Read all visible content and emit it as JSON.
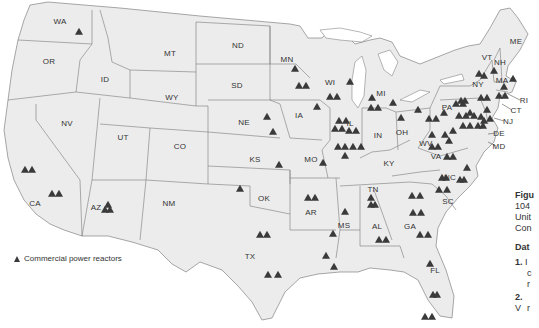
{
  "legend": {
    "icon": "triangle-reactor-icon",
    "label": "Commercial power reactors"
  },
  "caption": {
    "figure_prefix": "Figu",
    "line1": "104",
    "line2": "Unit",
    "line3": "Con",
    "data_heading": "Dat",
    "questions": [
      {
        "num": "1.",
        "lines": [
          "I",
          "c",
          "r"
        ]
      },
      {
        "num": "2.",
        "lines": [
          "V",
          "r"
        ]
      }
    ]
  },
  "states": [
    {
      "abbr": "WA",
      "x": 60,
      "y": 21
    },
    {
      "abbr": "OR",
      "x": 49,
      "y": 61
    },
    {
      "abbr": "ID",
      "x": 105,
      "y": 79
    },
    {
      "abbr": "MT",
      "x": 170,
      "y": 53
    },
    {
      "abbr": "WY",
      "x": 172,
      "y": 97
    },
    {
      "abbr": "NV",
      "x": 67,
      "y": 123
    },
    {
      "abbr": "UT",
      "x": 123,
      "y": 137
    },
    {
      "abbr": "CO",
      "x": 180,
      "y": 146
    },
    {
      "abbr": "CA",
      "x": 35,
      "y": 203
    },
    {
      "abbr": "AZ",
      "x": 96,
      "y": 207
    },
    {
      "abbr": "NM",
      "x": 169,
      "y": 203
    },
    {
      "abbr": "ND",
      "x": 238,
      "y": 45
    },
    {
      "abbr": "SD",
      "x": 237,
      "y": 85
    },
    {
      "abbr": "NE",
      "x": 244,
      "y": 122
    },
    {
      "abbr": "KS",
      "x": 255,
      "y": 159
    },
    {
      "abbr": "OK",
      "x": 264,
      "y": 198
    },
    {
      "abbr": "TX",
      "x": 250,
      "y": 256
    },
    {
      "abbr": "MN",
      "x": 287,
      "y": 59
    },
    {
      "abbr": "IA",
      "x": 299,
      "y": 115
    },
    {
      "abbr": "MO",
      "x": 311,
      "y": 159
    },
    {
      "abbr": "AR",
      "x": 311,
      "y": 212
    },
    {
      "abbr": "MS",
      "x": 344,
      "y": 225
    },
    {
      "abbr": "WI",
      "x": 330,
      "y": 82
    },
    {
      "abbr": "IL",
      "x": 350,
      "y": 123
    },
    {
      "abbr": "MI",
      "x": 381,
      "y": 93
    },
    {
      "abbr": "IN",
      "x": 378,
      "y": 135
    },
    {
      "abbr": "OH",
      "x": 402,
      "y": 132
    },
    {
      "abbr": "KY",
      "x": 389,
      "y": 163
    },
    {
      "abbr": "TN",
      "x": 373,
      "y": 189
    },
    {
      "abbr": "AL",
      "x": 377,
      "y": 226
    },
    {
      "abbr": "GA",
      "x": 410,
      "y": 226
    },
    {
      "abbr": "FL",
      "x": 435,
      "y": 270
    },
    {
      "abbr": "SC",
      "x": 448,
      "y": 201
    },
    {
      "abbr": "NC",
      "x": 450,
      "y": 177
    },
    {
      "abbr": "VA",
      "x": 436,
      "y": 156
    },
    {
      "abbr": "WV",
      "x": 426,
      "y": 143
    },
    {
      "abbr": "PA",
      "x": 447,
      "y": 107
    },
    {
      "abbr": "NY",
      "x": 478,
      "y": 84
    },
    {
      "abbr": "VT",
      "x": 487,
      "y": 57
    },
    {
      "abbr": "NH",
      "x": 500,
      "y": 62
    },
    {
      "abbr": "ME",
      "x": 516,
      "y": 41
    },
    {
      "abbr": "MA",
      "x": 502,
      "y": 80
    },
    {
      "abbr": "RI",
      "x": 524,
      "y": 100
    },
    {
      "abbr": "CT",
      "x": 516,
      "y": 110
    },
    {
      "abbr": "NJ",
      "x": 508,
      "y": 121
    },
    {
      "abbr": "DE",
      "x": 499,
      "y": 133
    },
    {
      "abbr": "MD",
      "x": 499,
      "y": 146
    }
  ],
  "reactors": [
    [
      79,
      32
    ],
    [
      25,
      170
    ],
    [
      32,
      170
    ],
    [
      52,
      194
    ],
    [
      59,
      194
    ],
    [
      105,
      210
    ],
    [
      110,
      210
    ],
    [
      108,
      205
    ],
    [
      295,
      69
    ],
    [
      299,
      86
    ],
    [
      306,
      86
    ],
    [
      317,
      107
    ],
    [
      267,
      117
    ],
    [
      273,
      132
    ],
    [
      279,
      165
    ],
    [
      323,
      163
    ],
    [
      240,
      189
    ],
    [
      308,
      198
    ],
    [
      315,
      198
    ],
    [
      260,
      235
    ],
    [
      267,
      235
    ],
    [
      268,
      275
    ],
    [
      278,
      275
    ],
    [
      326,
      256
    ],
    [
      334,
      267
    ],
    [
      333,
      234
    ],
    [
      345,
      212
    ],
    [
      371,
      205
    ],
    [
      375,
      205
    ],
    [
      371,
      198
    ],
    [
      379,
      240
    ],
    [
      386,
      240
    ],
    [
      412,
      196
    ],
    [
      420,
      196
    ],
    [
      413,
      213
    ],
    [
      421,
      213
    ],
    [
      420,
      235
    ],
    [
      428,
      235
    ],
    [
      430,
      264
    ],
    [
      433,
      295
    ],
    [
      437,
      295
    ],
    [
      425,
      317
    ],
    [
      432,
      317
    ],
    [
      330,
      97
    ],
    [
      337,
      97
    ],
    [
      350,
      82
    ],
    [
      339,
      121
    ],
    [
      346,
      121
    ],
    [
      335,
      129
    ],
    [
      342,
      129
    ],
    [
      349,
      131
    ],
    [
      356,
      131
    ],
    [
      338,
      147
    ],
    [
      345,
      147
    ],
    [
      353,
      147
    ],
    [
      361,
      147
    ],
    [
      345,
      156
    ],
    [
      371,
      108
    ],
    [
      372,
      98
    ],
    [
      378,
      108
    ],
    [
      393,
      103
    ],
    [
      401,
      118
    ],
    [
      418,
      110
    ],
    [
      429,
      119
    ],
    [
      436,
      119
    ],
    [
      444,
      113
    ],
    [
      432,
      147
    ],
    [
      438,
      147
    ],
    [
      447,
      157
    ],
    [
      453,
      157
    ],
    [
      432,
      135
    ],
    [
      445,
      135
    ],
    [
      449,
      141
    ],
    [
      453,
      131
    ],
    [
      456,
      104
    ],
    [
      463,
      104
    ],
    [
      459,
      116
    ],
    [
      466,
      116
    ],
    [
      474,
      116
    ],
    [
      470,
      113
    ],
    [
      463,
      126
    ],
    [
      470,
      126
    ],
    [
      478,
      126
    ],
    [
      483,
      126
    ],
    [
      484,
      121
    ],
    [
      490,
      119
    ],
    [
      481,
      117
    ],
    [
      481,
      98
    ],
    [
      487,
      98
    ],
    [
      487,
      110
    ],
    [
      494,
      71
    ],
    [
      499,
      96
    ],
    [
      505,
      96
    ],
    [
      479,
      74
    ],
    [
      484,
      76
    ],
    [
      504,
      87
    ],
    [
      513,
      79
    ],
    [
      439,
      190
    ],
    [
      447,
      190
    ],
    [
      460,
      180
    ],
    [
      464,
      180
    ],
    [
      467,
      168
    ],
    [
      442,
      178
    ],
    [
      446,
      178
    ],
    [
      461,
      101
    ],
    [
      465,
      101
    ]
  ]
}
